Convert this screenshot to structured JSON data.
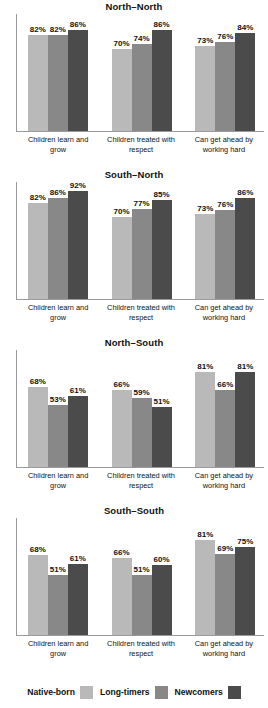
{
  "chart_data": {
    "type": "bar",
    "title": "",
    "xlabel": "",
    "ylabel": "",
    "ylim": [
      0,
      100
    ],
    "grid": false,
    "legend_position": "bottom",
    "categories": [
      "Children learn and grow",
      "Children treated with respect",
      "Can get ahead by working hard"
    ],
    "category_lines": [
      [
        "Children learn and grow",
        ""
      ],
      [
        "Children treated with",
        "respect"
      ],
      [
        "Can get ahead by",
        "working hard"
      ]
    ],
    "series_names": [
      "Native-born",
      "Long-timers",
      "Newcomers"
    ],
    "panels": [
      {
        "title": "North–North",
        "series": [
          {
            "name": "Native-born",
            "values": [
              82,
              70,
              73
            ]
          },
          {
            "name": "Long-timers",
            "values": [
              82,
              74,
              76
            ]
          },
          {
            "name": "Newcomers",
            "values": [
              86,
              86,
              84
            ]
          }
        ],
        "labels": [
          [
            "82%",
            "70%",
            "73%"
          ],
          [
            "82%",
            "74%",
            "76%"
          ],
          [
            "86%",
            "86%",
            "84%"
          ]
        ]
      },
      {
        "title": "South–North",
        "series": [
          {
            "name": "Native-born",
            "values": [
              82,
              70,
              73
            ]
          },
          {
            "name": "Long-timers",
            "values": [
              86,
              77,
              76
            ]
          },
          {
            "name": "Newcomers",
            "values": [
              92,
              85,
              86
            ]
          }
        ],
        "labels": [
          [
            "82%",
            "70%",
            "73%"
          ],
          [
            "86%",
            "77%",
            "76%"
          ],
          [
            "92%",
            "85%",
            "86%"
          ]
        ]
      },
      {
        "title": "North–South",
        "series": [
          {
            "name": "Native-born",
            "values": [
              68,
              66,
              81
            ]
          },
          {
            "name": "Long-timers",
            "values": [
              53,
              59,
              66
            ]
          },
          {
            "name": "Newcomers",
            "values": [
              61,
              51,
              81
            ]
          }
        ],
        "labels": [
          [
            "68%",
            "66%",
            "81%"
          ],
          [
            "53%",
            "59%",
            "66%"
          ],
          [
            "61%",
            "51%",
            "81%"
          ]
        ]
      },
      {
        "title": "South–South",
        "series": [
          {
            "name": "Native-born",
            "values": [
              68,
              66,
              81
            ]
          },
          {
            "name": "Long-timers",
            "values": [
              51,
              51,
              69
            ]
          },
          {
            "name": "Newcomers",
            "values": [
              61,
              60,
              75
            ]
          }
        ],
        "labels": [
          [
            "68%",
            "66%",
            "81%"
          ],
          [
            "51%",
            "51%",
            "69%"
          ],
          [
            "61%",
            "60%",
            "75%"
          ]
        ]
      }
    ],
    "colors": {
      "native_born": "#b9b9b9",
      "long_timers": "#888888",
      "newcomers": "#4b4b4b",
      "axis": "#9a9a9a",
      "text": "#111111",
      "background": "#ffffff"
    }
  },
  "legend": {
    "items": [
      {
        "label": "Native-born",
        "color": "#b9b9b9"
      },
      {
        "label": "Long-timers",
        "color": "#888888"
      },
      {
        "label": "Newcomers",
        "color": "#4b4b4b"
      }
    ]
  }
}
